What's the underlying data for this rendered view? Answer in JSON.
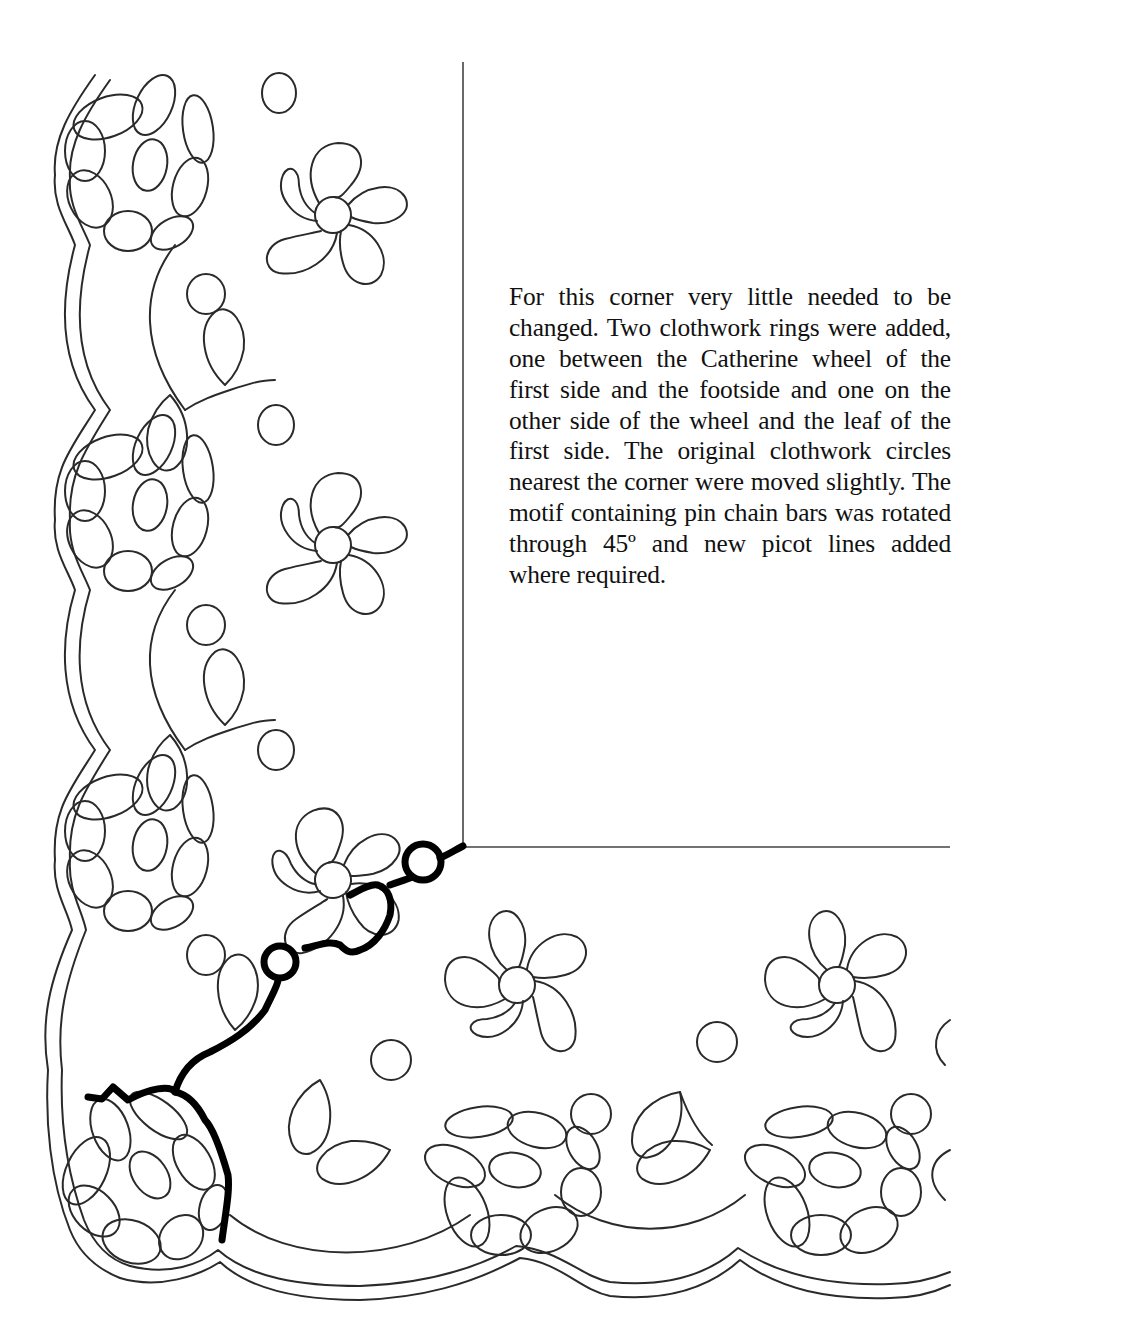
{
  "caption": {
    "text": "For this corner very little needed to be changed. Two clothwork rings were added, one between the Catherine wheel of the first side and the footside and one on the other side of the wheel and the leaf of the first side. The original clothwork circles nearest the corner were moved slightly. The motif containing pin chain bars was rotated through 45º and new picot lines added where required."
  },
  "drawing": {
    "subject": "bobbin lace corner pattern",
    "elements": [
      "rosette",
      "catherine-wheel",
      "clothwork-circle",
      "leaf",
      "footside",
      "pin-chain-bars",
      "clothwork-ring",
      "corner-guide-lines"
    ],
    "colors": {
      "line": "#2a2a2a",
      "highlight_line": "#000000",
      "background": "#ffffff"
    }
  }
}
